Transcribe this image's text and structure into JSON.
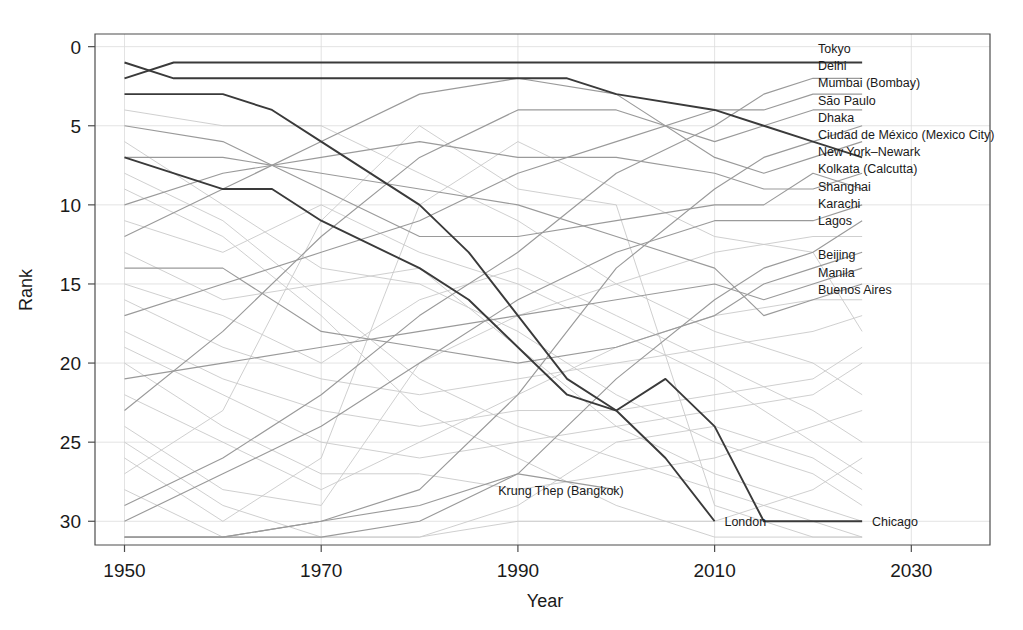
{
  "chart_data": {
    "type": "line",
    "title": "",
    "xlabel": "Year",
    "ylabel": "Rank",
    "xlim": [
      1947,
      2038
    ],
    "ylim": [
      31.5,
      -0.8
    ],
    "x_ticks": [
      1950,
      1970,
      1990,
      2010,
      2030
    ],
    "y_ticks": [
      0,
      5,
      10,
      15,
      20,
      25,
      30
    ],
    "grid": true,
    "legend": "inline-right-labels",
    "y_inverted": true,
    "note": "Bump chart of world city population ranks over time; rank 1 at top",
    "series": [
      {
        "name": "Tokyo",
        "highlight": true,
        "color": "#3a3a3a",
        "label_rank": 1,
        "x": [
          1950,
          1955,
          1960,
          1970,
          1980,
          1990,
          1995,
          2000,
          2010,
          2015,
          2020,
          2025
        ],
        "values": [
          2,
          1,
          1,
          1,
          1,
          1,
          1,
          1,
          1,
          1,
          1,
          1
        ]
      },
      {
        "name": "Delhi",
        "highlight": false,
        "color": "#9a9a9a",
        "label_rank": 2,
        "x": [
          1950,
          1960,
          1970,
          1980,
          1990,
          2000,
          2010,
          2015,
          2020,
          2025
        ],
        "values": [
          29,
          26,
          22,
          17,
          13,
          8,
          5,
          3,
          2,
          2
        ]
      },
      {
        "name": "Mumbai (Bombay)",
        "highlight": false,
        "color": "#9a9a9a",
        "label_rank": 3,
        "x": [
          1950,
          1960,
          1970,
          1980,
          1990,
          2000,
          2010,
          2015,
          2020,
          2025
        ],
        "values": [
          17,
          15,
          13,
          11,
          8,
          6,
          4,
          4,
          3,
          3
        ]
      },
      {
        "name": "São Paulo",
        "highlight": false,
        "color": "#9a9a9a",
        "label_rank": 4,
        "x": [
          1950,
          1960,
          1970,
          1980,
          1990,
          2000,
          2010,
          2015,
          2020,
          2025
        ],
        "values": [
          23,
          18,
          12,
          7,
          4,
          4,
          6,
          5,
          4,
          4
        ]
      },
      {
        "name": "Dhaka",
        "highlight": false,
        "color": "#9a9a9a",
        "label_rank": 5,
        "x": [
          1950,
          1960,
          1970,
          1980,
          1990,
          2000,
          2010,
          2015,
          2020,
          2025
        ],
        "values": [
          31,
          31,
          30,
          28,
          22,
          14,
          9,
          7,
          6,
          5
        ]
      },
      {
        "name": "Ciudad de México (Mexico City)",
        "highlight": false,
        "color": "#9a9a9a",
        "label_rank": 6,
        "x": [
          1950,
          1960,
          1970,
          1980,
          1990,
          2000,
          2010,
          2015,
          2020,
          2025
        ],
        "values": [
          12,
          9,
          6,
          3,
          2,
          3,
          7,
          8,
          7,
          6
        ]
      },
      {
        "name": "New York–Newark",
        "highlight": true,
        "color": "#3a3a3a",
        "label_rank": 7,
        "x": [
          1950,
          1955,
          1960,
          1970,
          1980,
          1990,
          1995,
          2000,
          2010,
          2015,
          2020,
          2025
        ],
        "values": [
          1,
          2,
          2,
          2,
          2,
          2,
          2,
          3,
          4,
          5,
          6,
          7
        ]
      },
      {
        "name": "Kolkata (Calcutta)",
        "highlight": false,
        "color": "#9a9a9a",
        "label_rank": 8,
        "x": [
          1950,
          1960,
          1970,
          1980,
          1990,
          2000,
          2010,
          2015,
          2020,
          2025
        ],
        "values": [
          10,
          8,
          7,
          6,
          7,
          7,
          8,
          9,
          9,
          8
        ]
      },
      {
        "name": "Shanghai",
        "highlight": false,
        "color": "#9a9a9a",
        "label_rank": 9,
        "x": [
          1950,
          1960,
          1970,
          1980,
          1990,
          2000,
          2010,
          2015,
          2020,
          2025
        ],
        "values": [
          5,
          6,
          9,
          12,
          12,
          11,
          10,
          10,
          8,
          9
        ]
      },
      {
        "name": "Karachi",
        "highlight": false,
        "color": "#9a9a9a",
        "label_rank": 10,
        "x": [
          1950,
          1960,
          1970,
          1980,
          1990,
          2000,
          2010,
          2015,
          2020,
          2025
        ],
        "values": [
          30,
          27,
          24,
          20,
          16,
          13,
          11,
          11,
          11,
          10
        ]
      },
      {
        "name": "Lagos",
        "highlight": false,
        "color": "#9a9a9a",
        "label_rank": 11,
        "x": [
          1950,
          1960,
          1970,
          1980,
          1990,
          2000,
          2010,
          2015,
          2020,
          2025
        ],
        "values": [
          31,
          31,
          31,
          30,
          27,
          21,
          16,
          14,
          13,
          11
        ]
      },
      {
        "name": "Beijing",
        "highlight": false,
        "color": "#9a9a9a",
        "label_rank": 13,
        "x": [
          1950,
          1960,
          1970,
          1980,
          1990,
          2000,
          2010,
          2015,
          2020,
          2025
        ],
        "values": [
          14,
          14,
          18,
          19,
          20,
          19,
          17,
          15,
          14,
          13
        ]
      },
      {
        "name": "Manila",
        "highlight": false,
        "color": "#9a9a9a",
        "label_rank": 14,
        "x": [
          1950,
          1960,
          1970,
          1980,
          1990,
          2000,
          2010,
          2015,
          2020,
          2025
        ],
        "values": [
          21,
          20,
          19,
          18,
          17,
          16,
          15,
          16,
          15,
          14
        ]
      },
      {
        "name": "Buenos Aires",
        "highlight": false,
        "color": "#9a9a9a",
        "label_rank": 15,
        "x": [
          1950,
          1960,
          1970,
          1980,
          1990,
          2000,
          2010,
          2015,
          2020,
          2025
        ],
        "values": [
          7,
          7,
          8,
          9,
          10,
          12,
          14,
          17,
          16,
          15
        ]
      },
      {
        "name": "Krung Thep (Bangkok)",
        "highlight": false,
        "color": "#9a9a9a",
        "label_rank": 28,
        "label_x": 1988,
        "x": [
          1950,
          1960,
          1970,
          1980,
          1990,
          2000
        ],
        "values": [
          31,
          31,
          30,
          29,
          27,
          28
        ]
      },
      {
        "name": "London",
        "highlight": true,
        "color": "#3a3a3a",
        "label_rank": 30,
        "label_x": 2011,
        "x": [
          1950,
          1960,
          1965,
          1970,
          1980,
          1985,
          1990,
          1995,
          2000,
          2005,
          2010
        ],
        "values": [
          3,
          3,
          4,
          6,
          10,
          13,
          17,
          21,
          23,
          26,
          30
        ]
      },
      {
        "name": "Chicago",
        "highlight": true,
        "color": "#3a3a3a",
        "label_rank": 30,
        "label_x": 2026,
        "x": [
          1950,
          1960,
          1965,
          1970,
          1980,
          1985,
          1990,
          1995,
          2000,
          2005,
          2010,
          2015,
          2025
        ],
        "values": [
          7,
          9,
          9,
          11,
          14,
          16,
          19,
          22,
          23,
          21,
          24,
          30,
          30
        ]
      },
      {
        "name": "ghost-a",
        "highlight": false,
        "color": "#c9c9c9",
        "label_rank": null,
        "x": [
          1950,
          1960,
          1970,
          1980,
          1990,
          2000,
          2010,
          2020,
          2025
        ],
        "values": [
          4,
          5,
          5,
          8,
          11,
          15,
          18,
          20,
          22
        ]
      },
      {
        "name": "ghost-b",
        "highlight": false,
        "color": "#c9c9c9",
        "label_rank": null,
        "x": [
          1950,
          1960,
          1970,
          1980,
          1990,
          2000,
          2010,
          2020,
          2025
        ],
        "values": [
          6,
          10,
          14,
          15,
          18,
          22,
          25,
          27,
          29
        ]
      },
      {
        "name": "ghost-c",
        "highlight": false,
        "color": "#c9c9c9",
        "label_rank": null,
        "x": [
          1950,
          1960,
          1970,
          1980,
          1990,
          2000,
          2010,
          2020,
          2025
        ],
        "values": [
          8,
          11,
          16,
          21,
          24,
          26,
          28,
          30,
          31
        ]
      },
      {
        "name": "ghost-d",
        "highlight": false,
        "color": "#c9c9c9",
        "label_rank": null,
        "x": [
          1950,
          1960,
          1970,
          1980,
          1990,
          2000,
          2010,
          2020,
          2025
        ],
        "values": [
          9,
          12,
          17,
          23,
          26,
          29,
          31,
          31,
          31
        ]
      },
      {
        "name": "ghost-e",
        "highlight": false,
        "color": "#c9c9c9",
        "label_rank": null,
        "x": [
          1950,
          1960,
          1970,
          1980,
          1990,
          2000,
          2010,
          2020,
          2025
        ],
        "values": [
          11,
          13,
          10,
          13,
          15,
          18,
          21,
          25,
          27
        ]
      },
      {
        "name": "ghost-f",
        "highlight": false,
        "color": "#c9c9c9",
        "label_rank": null,
        "x": [
          1950,
          1960,
          1970,
          1980,
          1990,
          2000,
          2010,
          2020,
          2025
        ],
        "values": [
          13,
          16,
          15,
          14,
          19,
          24,
          27,
          29,
          30
        ]
      },
      {
        "name": "ghost-g",
        "highlight": false,
        "color": "#c9c9c9",
        "label_rank": null,
        "x": [
          1950,
          1960,
          1970,
          1980,
          1990,
          2000,
          2010,
          2020,
          2025
        ],
        "values": [
          15,
          17,
          20,
          16,
          14,
          17,
          20,
          23,
          25
        ]
      },
      {
        "name": "ghost-h",
        "highlight": false,
        "color": "#c9c9c9",
        "label_rank": null,
        "x": [
          1950,
          1960,
          1970,
          1980,
          1990,
          2000,
          2010,
          2020,
          2025
        ],
        "values": [
          16,
          19,
          21,
          22,
          21,
          20,
          19,
          18,
          17
        ]
      },
      {
        "name": "ghost-i",
        "highlight": false,
        "color": "#c9c9c9",
        "label_rank": null,
        "x": [
          1950,
          1960,
          1970,
          1980,
          1990,
          2000,
          2010,
          2020,
          2025
        ],
        "values": [
          18,
          21,
          23,
          24,
          23,
          23,
          22,
          21,
          19
        ]
      },
      {
        "name": "ghost-j",
        "highlight": false,
        "color": "#c9c9c9",
        "label_rank": null,
        "x": [
          1950,
          1960,
          1970,
          1980,
          1990,
          2000,
          2010,
          2020,
          2025
        ],
        "values": [
          19,
          22,
          25,
          26,
          25,
          24,
          23,
          22,
          20
        ]
      },
      {
        "name": "ghost-k",
        "highlight": false,
        "color": "#c9c9c9",
        "label_rank": null,
        "x": [
          1950,
          1960,
          1970,
          1980,
          1990,
          2000,
          2010,
          2020,
          2025
        ],
        "values": [
          20,
          24,
          27,
          27,
          28,
          27,
          26,
          24,
          23
        ]
      },
      {
        "name": "ghost-l",
        "highlight": false,
        "color": "#c9c9c9",
        "label_rank": null,
        "x": [
          1950,
          1960,
          1970,
          1980,
          1990,
          2000,
          2010,
          2020,
          2025
        ],
        "values": [
          22,
          25,
          28,
          25,
          22,
          19,
          17,
          16,
          16
        ]
      },
      {
        "name": "ghost-m",
        "highlight": false,
        "color": "#c9c9c9",
        "label_rank": null,
        "x": [
          1950,
          1960,
          1970,
          1980,
          1990,
          2000,
          2010,
          2020,
          2025
        ],
        "values": [
          24,
          28,
          29,
          20,
          17,
          15,
          13,
          12,
          12
        ]
      },
      {
        "name": "ghost-n",
        "highlight": false,
        "color": "#c9c9c9",
        "label_rank": null,
        "x": [
          1950,
          1960,
          1970,
          1980,
          1990,
          2000,
          2010,
          2020,
          2025
        ],
        "values": [
          25,
          29,
          31,
          31,
          29,
          25,
          24,
          26,
          28
        ]
      },
      {
        "name": "ghost-o",
        "highlight": false,
        "color": "#c9c9c9",
        "label_rank": null,
        "x": [
          1950,
          1960,
          1970,
          1980,
          1990,
          2000,
          2010,
          2020,
          2025
        ],
        "values": [
          26,
          30,
          26,
          10,
          6,
          9,
          12,
          13,
          18
        ]
      },
      {
        "name": "ghost-p",
        "highlight": false,
        "color": "#c9c9c9",
        "label_rank": null,
        "x": [
          1950,
          1960,
          1970,
          1980,
          1990,
          2000,
          2010,
          2020,
          2025
        ],
        "values": [
          27,
          23,
          11,
          5,
          9,
          10,
          29,
          31,
          31
        ]
      },
      {
        "name": "ghost-q",
        "highlight": false,
        "color": "#c9c9c9",
        "label_rank": null,
        "x": [
          1950,
          1960,
          1970,
          1980,
          1990,
          2000,
          2010,
          2020,
          2025
        ],
        "values": [
          28,
          31,
          31,
          31,
          30,
          30,
          30,
          28,
          26
        ]
      }
    ]
  },
  "axes": {
    "y_title": "Rank",
    "x_title": "Year",
    "y_tick_labels": [
      "0",
      "5",
      "10",
      "15",
      "20",
      "25",
      "30"
    ],
    "x_tick_labels": [
      "1950",
      "1970",
      "1990",
      "2010",
      "2030"
    ]
  },
  "colors": {
    "highlight": "#3a3a3a",
    "muted": "#9a9a9a",
    "ghost": "#c9c9c9",
    "grid": "#dcdcdc",
    "axis": "#4d4d4d",
    "text": "#1a1a1a",
    "background": "#ffffff"
  }
}
